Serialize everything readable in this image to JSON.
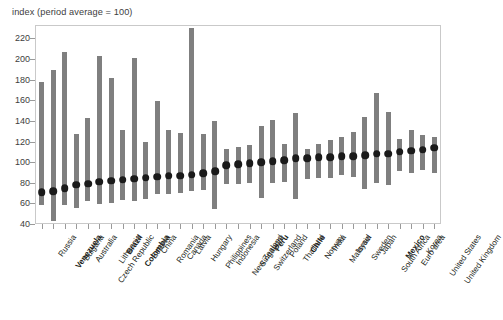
{
  "chart": {
    "title": "index (period average = 100)",
    "axis": {
      "y_ticks": [
        220,
        200,
        180,
        160,
        140,
        120,
        100,
        80,
        60,
        40
      ],
      "y_min": 40,
      "y_max": 232
    }
  },
  "chart_data": {
    "type": "bar",
    "chart_subtype": "range-bar-with-average-marker",
    "title": "index (period average = 100)",
    "xlabel": "",
    "ylabel": "index (period average = 100)",
    "ylim": [
      40,
      232
    ],
    "ytick_labels": [
      "40",
      "60",
      "80",
      "100",
      "120",
      "140",
      "160",
      "180",
      "200",
      "220"
    ],
    "grid": false,
    "legend": "none",
    "series": [
      {
        "name": "range (min to max)",
        "type": "bar",
        "color": "#7f7f7f"
      },
      {
        "name": "period average",
        "type": "scatter",
        "color": "#1a1a1a"
      }
    ],
    "categories": [
      "Russia",
      "Venezuela",
      "Bulgaria",
      "Australia",
      "Czech Republic",
      "Lithuania",
      "Brazil",
      "Colombia",
      "Estonia",
      "China",
      "Romania",
      "Canada",
      "Latvia",
      "Hungary",
      "Philippines",
      "Indonesia",
      "New Zealand",
      "Singapore",
      "Switzerland",
      "Peru",
      "Poland",
      "Thailand",
      "Chile",
      "Norway",
      "India",
      "Malaysia",
      "Israel",
      "Sweden",
      "Japan",
      "South Africa",
      "Mexico",
      "Euro area",
      "Korea",
      "United States",
      "United Kingdom"
    ],
    "highlighted_categories": [
      "Venezuela",
      "Brazil",
      "Colombia",
      "Peru",
      "Chile",
      "Mexico"
    ],
    "range_low": [
      58,
      43,
      58,
      56,
      62,
      59,
      60,
      63,
      62,
      64,
      69,
      69,
      70,
      72,
      73,
      55,
      79,
      79,
      80,
      65,
      80,
      81,
      64,
      84,
      85,
      85,
      88,
      86,
      74,
      80,
      78,
      91,
      89,
      92,
      89
    ],
    "range_high": [
      178,
      189,
      207,
      127,
      143,
      203,
      182,
      131,
      201,
      120,
      159,
      131,
      128,
      230,
      127,
      140,
      113,
      115,
      117,
      135,
      141,
      118,
      148,
      113,
      118,
      121,
      124,
      129,
      144,
      167,
      149,
      122,
      131,
      126,
      124
    ],
    "average": [
      71,
      72,
      75,
      78,
      79,
      81,
      82,
      83,
      84,
      85,
      86,
      87,
      87,
      88,
      89,
      91,
      97,
      98,
      99,
      100,
      101,
      102,
      104,
      104,
      105,
      105,
      106,
      106,
      107,
      108,
      108,
      110,
      111,
      112,
      114
    ]
  }
}
